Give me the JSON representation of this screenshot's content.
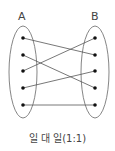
{
  "diagram": {
    "set_a_label": "A",
    "set_b_label": "B",
    "caption": "일 대 일(1:1)",
    "connections": [
      {
        "from": "A1",
        "to": "B2"
      },
      {
        "from": "A2",
        "to": "B4"
      },
      {
        "from": "A3",
        "to": "B1"
      },
      {
        "from": "A4",
        "to": "B3"
      },
      {
        "from": "A5",
        "to": "B5"
      }
    ],
    "colors": {
      "line": "#555555",
      "dot": "#111111"
    }
  }
}
